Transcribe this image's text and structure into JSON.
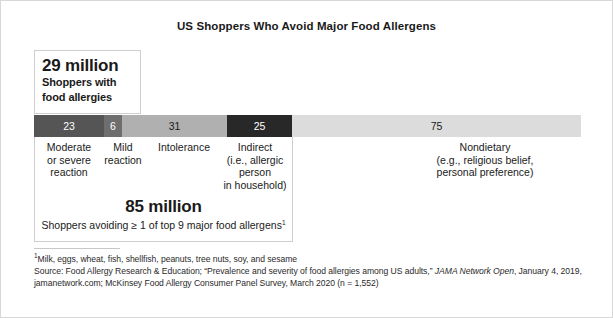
{
  "chart_data": {
    "type": "bar",
    "orientation": "horizontal-stacked",
    "title": "US Shoppers Who Avoid Major Food Allergens",
    "xlabel": "",
    "ylabel": "",
    "unit": "millions of US shoppers",
    "total": 160,
    "categories": [
      "Moderate or severe reaction",
      "Mild reaction",
      "Intolerance",
      "Indirect (i.e., allergic person in household)",
      "Nondietary (e.g., religious belief, personal preference)"
    ],
    "values": [
      23,
      6,
      31,
      25,
      75
    ],
    "colors": [
      "#555555",
      "#6e6e6e",
      "#b0b0b0",
      "#282828",
      "#dcdcdc"
    ],
    "label_colors": [
      "#ffffff",
      "#ffffff",
      "#1a1a1a",
      "#ffffff",
      "#1a1a1a"
    ],
    "grid": false,
    "legend": "none"
  },
  "segments": [
    {
      "value": "23",
      "label_lines": [
        "Moderate",
        "or severe",
        "reaction"
      ],
      "color": "#555555",
      "label_color": "#ffffff",
      "left_pct": 0.0,
      "width_pct": 12.8,
      "label_left": 34,
      "label_width": 70,
      "label_top": 141
    },
    {
      "value": "6",
      "label_lines": [
        "Mild",
        "reaction"
      ],
      "color": "#6e6e6e",
      "label_color": "#ffffff",
      "left_pct": 12.8,
      "width_pct": 3.3,
      "label_left": 100,
      "label_width": 46,
      "label_top": 141
    },
    {
      "value": "31",
      "label_lines": [
        "Intolerance"
      ],
      "color": "#b0b0b0",
      "label_color": "#1a1a1a",
      "left_pct": 16.1,
      "width_pct": 19.2,
      "label_left": 144,
      "label_width": 80,
      "label_top": 141
    },
    {
      "value": "25",
      "label_lines": [
        "Indirect",
        "(i.e., allergic",
        "person",
        "in household)"
      ],
      "color": "#282828",
      "label_color": "#ffffff",
      "left_pct": 35.3,
      "width_pct": 11.9,
      "label_left": 217,
      "label_width": 76,
      "label_top": 141
    },
    {
      "value": "75",
      "label_lines": [
        "Nondietary",
        "(e.g., religious belief,",
        "personal preference)"
      ],
      "color": "#dcdcdc",
      "label_color": "#1a1a1a",
      "left_pct": 47.2,
      "width_pct": 52.8,
      "label_left": 385,
      "label_width": 200,
      "label_top": 141
    }
  ],
  "callout_29": {
    "headline": "29 million",
    "line1": "Shoppers with",
    "line2": "food allergies"
  },
  "callout_85": {
    "headline": "85 million",
    "description": "Shoppers avoiding ≥ 1 of top 9 major food allergens",
    "footnote_marker": "1"
  },
  "footnotes": {
    "note1_marker": "1",
    "note1": "Milk, eggs, wheat, fish, shellfish, peanuts, tree nuts, soy, and sesame",
    "source_part1": "Source: Food Allergy Research & Education; “Prevalence and severity of food allergies among US adults,” ",
    "source_italic": "JAMA Network Open",
    "source_part2": ", January 4, 2019,",
    "source_line3": "jamanetwork.com; McKinsey Food Allergy Consumer Panel Survey, March 2020 (n = 1,552)"
  }
}
